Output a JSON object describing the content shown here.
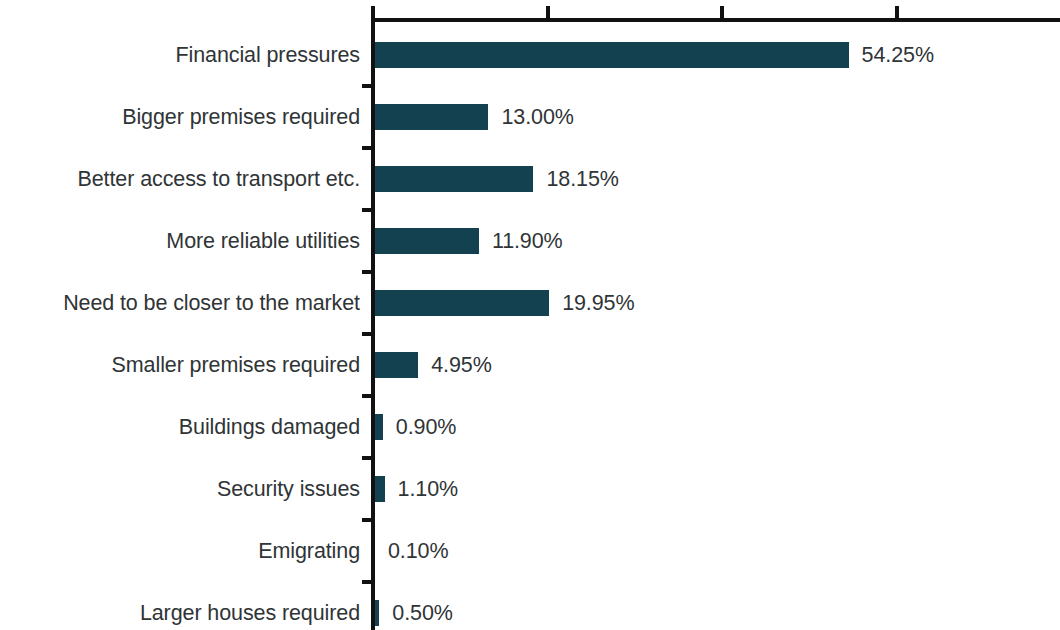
{
  "chart_data": {
    "type": "bar",
    "orientation": "horizontal",
    "title": "",
    "subtitle": "",
    "xlabel": "",
    "ylabel": "",
    "xlim": [
      0,
      78.9
    ],
    "grid": false,
    "legend": null,
    "value_label_format": "0.00%",
    "bar_color": "#14414f",
    "text_color": "#2f3436",
    "axis_color": "#111111",
    "background": "#ffffff",
    "x_axis_position": "top",
    "x_ticks": [
      0,
      20,
      40,
      60
    ],
    "x_tick_labels": [
      "",
      "",
      "",
      ""
    ],
    "categories": [
      "Financial pressures",
      "Bigger premises required",
      "Better access to transport etc.",
      "More reliable utilities",
      "Need to be closer to the market",
      "Smaller premises required",
      "Buildings damaged",
      "Security issues",
      "Emigrating",
      "Larger houses required"
    ],
    "values": [
      54.25,
      13.0,
      18.15,
      11.9,
      19.95,
      4.95,
      0.9,
      1.1,
      0.1,
      0.5
    ],
    "value_labels": [
      "54.25%",
      "13.00%",
      "18.15%",
      "11.90%",
      "19.95%",
      "4.95%",
      "0.90%",
      "1.10%",
      "0.10%",
      "0.50%"
    ]
  }
}
